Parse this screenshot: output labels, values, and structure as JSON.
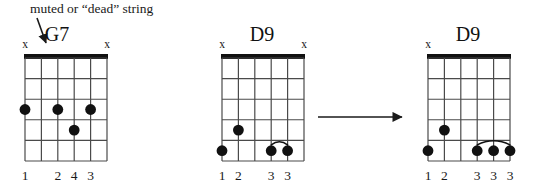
{
  "annotation": {
    "caption": "muted or “dead” string",
    "caption_x": 30,
    "caption_y": 2,
    "arrow_icon": "down-right-arrow-icon",
    "arrow": {
      "x1": 37,
      "y1": 18,
      "x2": 46,
      "y2": 43
    }
  },
  "transition_arrow": {
    "icon": "right-arrow-icon",
    "x1": 318,
    "y1": 117,
    "x2": 402,
    "y2": 117
  },
  "colors": {
    "ink": "#1a1a1a",
    "grid_line": "#4a4a4a",
    "nut": "#111111",
    "dot": "#111111",
    "paper": "#ffffff"
  },
  "geometry": {
    "string_count": 6,
    "fret_count": 5,
    "string_gap": 16.4,
    "fret_gap": 20.6,
    "dot_radius": 5.4,
    "nut_thickness": 5
  },
  "diagrams": [
    {
      "id": "g7",
      "name": "G7",
      "title": "G7",
      "title_x": 57,
      "title_y": 24,
      "grid_x": 25,
      "grid_y": 58,
      "grid_w": 82,
      "grid_h": 103,
      "mutes": [
        {
          "string": 1,
          "label": "x"
        },
        {
          "string": 6,
          "label": "x"
        }
      ],
      "dots": [
        {
          "string": 1,
          "fret": 3
        },
        {
          "string": 3,
          "fret": 3
        },
        {
          "string": 4,
          "fret": 4
        },
        {
          "string": 5,
          "fret": 3
        }
      ],
      "arcs": [],
      "fingering": [
        {
          "string": 1,
          "label": "1"
        },
        {
          "string": 3,
          "label": "2"
        },
        {
          "string": 4,
          "label": "4"
        },
        {
          "string": 5,
          "label": "3"
        }
      ]
    },
    {
      "id": "d9-before",
      "name": "D9",
      "title": "D9",
      "title_x": 262,
      "title_y": 24,
      "grid_x": 222,
      "grid_y": 58,
      "grid_w": 82,
      "grid_h": 103,
      "mutes": [
        {
          "string": 1,
          "label": "x"
        },
        {
          "string": 6,
          "label": "x"
        }
      ],
      "dots": [
        {
          "string": 1,
          "fret": 5
        },
        {
          "string": 2,
          "fret": 4
        },
        {
          "string": 4,
          "fret": 5
        },
        {
          "string": 5,
          "fret": 5
        }
      ],
      "arcs": [
        {
          "from_string": 4,
          "to_string": 5,
          "fret": 5
        }
      ],
      "fingering": [
        {
          "string": 1,
          "label": "1"
        },
        {
          "string": 2,
          "label": "2"
        },
        {
          "string": 4,
          "label": "3"
        },
        {
          "string": 5,
          "label": "3"
        }
      ]
    },
    {
      "id": "d9-after",
      "name": "D9",
      "title": "D9",
      "title_x": 468,
      "title_y": 24,
      "grid_x": 428,
      "grid_y": 58,
      "grid_w": 82,
      "grid_h": 103,
      "mutes": [
        {
          "string": 1,
          "label": "x"
        }
      ],
      "dots": [
        {
          "string": 1,
          "fret": 5
        },
        {
          "string": 2,
          "fret": 4
        },
        {
          "string": 4,
          "fret": 5
        },
        {
          "string": 5,
          "fret": 5
        },
        {
          "string": 6,
          "fret": 5
        }
      ],
      "arcs": [
        {
          "from_string": 4,
          "to_string": 6,
          "fret": 5
        }
      ],
      "fingering": [
        {
          "string": 1,
          "label": "1"
        },
        {
          "string": 2,
          "label": "2"
        },
        {
          "string": 4,
          "label": "3"
        },
        {
          "string": 5,
          "label": "3"
        },
        {
          "string": 6,
          "label": "3"
        }
      ]
    }
  ]
}
